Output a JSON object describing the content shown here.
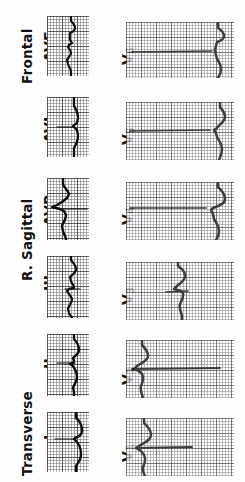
{
  "figure": {
    "orientation_deg": -90,
    "background_color": "#ffffff",
    "trace_color": "#0d0d0d",
    "grid_color": "#46464e",
    "paper": "ECG graph paper, 1 mm fine grid, 5 mm bold grid"
  },
  "planes": [
    {
      "id": "transverse",
      "label": "Transverse",
      "leads": [
        "I",
        "II"
      ]
    },
    {
      "id": "r-sagittal",
      "label": "R. Sagittal",
      "leads": [
        "III",
        "AVR"
      ]
    },
    {
      "id": "frontal",
      "label": "Frontal",
      "leads": [
        "AVL",
        "AVF"
      ]
    }
  ],
  "limb_leads": [
    {
      "id": "avf",
      "label": "AVF",
      "plane": "Frontal"
    },
    {
      "id": "avl",
      "label": "AVL",
      "plane": "Frontal"
    },
    {
      "id": "avr",
      "label": "AVR",
      "plane": "R. Sagittal"
    },
    {
      "id": "iii",
      "label": "III",
      "plane": "R. Sagittal"
    },
    {
      "id": "ii",
      "label": "II",
      "plane": "Transverse"
    },
    {
      "id": "i",
      "label": "I",
      "plane": "Transverse"
    }
  ],
  "precordial_leads": [
    {
      "id": "v6",
      "label": "V",
      "sub": "6"
    },
    {
      "id": "v5",
      "label": "V",
      "sub": "5"
    },
    {
      "id": "v4",
      "label": "V",
      "sub": "4"
    },
    {
      "id": "v3",
      "label": "V",
      "sub": "3"
    },
    {
      "id": "v2",
      "label": "V",
      "sub": "2"
    },
    {
      "id": "v1",
      "label": "V",
      "sub": "1"
    }
  ]
}
